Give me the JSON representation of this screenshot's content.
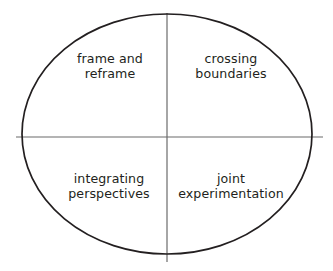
{
  "figure": {
    "type": "quadrant-ellipse-diagram",
    "background_color": "#ffffff",
    "outline_color": "#231f20",
    "divider_color": "#6b6b6b",
    "text_color": "#231f20",
    "ellipse": {
      "center_x": 167,
      "center_y": 134,
      "radius_x": 145,
      "radius_y": 120,
      "stroke_width": 1.6
    },
    "dividers": {
      "vertical": {
        "x": 167,
        "y_start": 13,
        "y_end": 262,
        "stroke_width": 1.2
      },
      "horizontal": {
        "y": 137,
        "x_start": 16,
        "x_end": 323,
        "stroke_width": 1.2
      }
    },
    "quadrants": [
      {
        "position": "top-left",
        "label": "frame and\nreframe",
        "line1": "frame and",
        "line2": "reframe"
      },
      {
        "position": "top-right",
        "label": "crossing\nboundaries",
        "line1": "crossing",
        "line2": "boundaries"
      },
      {
        "position": "bottom-left",
        "label": "integrating\nperspectives",
        "line1": "integrating",
        "line2": "perspectives"
      },
      {
        "position": "bottom-right",
        "label": "joint\nexperimentation",
        "line1": "joint",
        "line2": "experimentation"
      }
    ]
  }
}
